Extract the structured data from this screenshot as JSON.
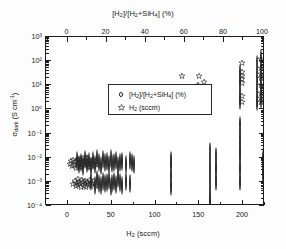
{
  "figure": {
    "background": "#ffffff",
    "frame_color": "#1b1b1b"
  },
  "axes": {
    "top": {
      "title_html": "[H<sub>2</sub>]/[H<sub>2</sub>+SiH<sub>4</sub>] (%)",
      "title_text": "[H2]/[H2+SiH4] (%)",
      "ticks": [
        0,
        20,
        40,
        60,
        80,
        100
      ],
      "tick_labels": [
        "0",
        "20",
        "40",
        "60",
        "80",
        "100"
      ],
      "lim": [
        -11,
        101
      ]
    },
    "bottom": {
      "title_html": "H<sub>2</sub> (sccm)",
      "title_text": "H2 (sccm)",
      "ticks": [
        0,
        50,
        100,
        150,
        200
      ],
      "tick_labels": [
        "0",
        "50",
        "100",
        "150",
        "200"
      ],
      "lim": [
        -25,
        225
      ]
    },
    "left": {
      "title_html": "&#963;<sub>dark</sub> (S cm<sup>-1</sup>)",
      "title_text": "sigma_dark (S cm^-1)",
      "ticks": [
        3,
        2,
        1,
        0,
        -1,
        -2,
        -3,
        -4
      ],
      "tick_labels": [
        "10³",
        "10²",
        "10¹",
        "10⁰",
        "10⁻¹",
        "10⁻²",
        "10⁻³",
        "10⁻⁴"
      ],
      "lim": [
        -4,
        3
      ],
      "scale": "log"
    }
  },
  "legend": {
    "position": "upper-left-inside",
    "entries": [
      {
        "marker": "circle-marker",
        "label_html": "[H<sub>2</sub>]/[H<sub>2</sub>+SiH<sub>4</sub>] (%)",
        "label_text": "[H2]/[H2+SiH4] (%)"
      },
      {
        "marker": "star-marker",
        "label_html": "H<sub>2</sub> (sccm)",
        "label_text": "H2 (sccm)"
      }
    ]
  },
  "chart_data": {
    "type": "scatter",
    "title": "",
    "xlabel": "H2 (sccm)",
    "ylabel": "sigma_dark (S cm^-1)",
    "xlabel_top": "[H2]/[H2+SiH4] (%)",
    "xlim": [
      -25,
      225
    ],
    "ylim": [
      0.0001,
      1000
    ],
    "xlim_top": [
      -11,
      101
    ],
    "yscale": "log",
    "grid": false,
    "legend_position": "upper left",
    "series": [
      {
        "name": "[H2]/[H2+SiH4] (%)",
        "marker": "circle",
        "x_axis": "top",
        "points": [
          [
            5,
            0.007
          ],
          [
            6,
            0.0052
          ],
          [
            7,
            0.0061
          ],
          [
            8,
            0.0043
          ],
          [
            9,
            0.008
          ],
          [
            10,
            0.0055
          ],
          [
            11,
            0.0068
          ],
          [
            12,
            0.004
          ],
          [
            13,
            0.0075
          ],
          [
            14,
            0.005
          ],
          [
            15,
            0.009
          ],
          [
            16,
            0.006
          ],
          [
            17,
            0.0046
          ],
          [
            18,
            0.0078
          ],
          [
            19,
            0.0058
          ],
          [
            20,
            0.0065
          ],
          [
            21,
            0.0049
          ],
          [
            22,
            0.0085
          ],
          [
            23,
            0.0054
          ],
          [
            24,
            0.0062
          ],
          [
            25,
            0.0072
          ],
          [
            26,
            0.0044
          ],
          [
            27,
            0.0059
          ],
          [
            28,
            0.0069
          ],
          [
            30,
            0.0051
          ],
          [
            32,
            0.0071
          ],
          [
            33,
            0.0063
          ],
          [
            34,
            0.0048
          ],
          [
            12,
            0.00095
          ],
          [
            14,
            0.0007
          ],
          [
            15,
            0.0012
          ],
          [
            16,
            0.00085
          ],
          [
            17,
            0.00065
          ],
          [
            18,
            0.001
          ],
          [
            19,
            0.00078
          ],
          [
            20,
            0.0009
          ],
          [
            21,
            0.0011
          ],
          [
            22,
            0.0006
          ],
          [
            23,
            0.00082
          ],
          [
            24,
            0.00098
          ],
          [
            25,
            0.00073
          ],
          [
            26,
            0.0013
          ],
          [
            27,
            0.00088
          ],
          [
            28,
            0.00068
          ],
          [
            30,
            0.001
          ],
          [
            32,
            0.0008
          ],
          [
            53,
            0.007
          ],
          [
            53,
            0.0055
          ],
          [
            53,
            0.0016
          ],
          [
            53,
            0.0006
          ],
          [
            73,
            0.018
          ],
          [
            73,
            0.012
          ],
          [
            73,
            0.009
          ],
          [
            73,
            0.007
          ],
          [
            73,
            0.0055
          ],
          [
            73,
            0.0042
          ],
          [
            73,
            0.0031
          ],
          [
            73,
            0.0023
          ],
          [
            73,
            0.0014
          ],
          [
            73,
            0.0009
          ],
          [
            73,
            0.00065
          ],
          [
            73,
            0.00045
          ],
          [
            73,
            0.00033
          ],
          [
            73,
            0.00024
          ],
          [
            73,
            0.00017
          ],
          [
            76,
            0.011
          ],
          [
            76,
            0.0075
          ],
          [
            76,
            0.005
          ],
          [
            76,
            0.003
          ],
          [
            76,
            0.001
          ],
          [
            88,
            0.0095
          ],
          [
            88,
            0.007
          ],
          [
            88,
            0.005
          ],
          [
            88,
            0.003
          ],
          [
            88,
            0.001
          ],
          [
            100,
            0.008
          ],
          [
            100,
            0.0055
          ],
          [
            100,
            0.0021
          ],
          [
            112,
            0.011
          ],
          [
            112,
            0.006
          ],
          [
            112,
            0.0038
          ],
          [
            88,
            0.2
          ],
          [
            88,
            0.09
          ],
          [
            88,
            0.045
          ],
          [
            88,
            0.026
          ],
          [
            88,
            0.014
          ],
          [
            88,
            4.0
          ],
          [
            88,
            30.0
          ],
          [
            88,
            20.0
          ],
          [
            88,
            12.0
          ],
          [
            88,
            3.5
          ],
          [
            88,
            2.2
          ],
          [
            97,
            70.0
          ],
          [
            97,
            50.0
          ],
          [
            97,
            40.0
          ],
          [
            97,
            32.0
          ],
          [
            97,
            25.0
          ],
          [
            97,
            18.0
          ],
          [
            97,
            12.0
          ],
          [
            97,
            8.0
          ],
          [
            97,
            5.5
          ],
          [
            97,
            4.0
          ],
          [
            97,
            2.8
          ],
          [
            97,
            2.0
          ],
          [
            99,
            120.0
          ],
          [
            99,
            60.0
          ],
          [
            99,
            35.0
          ],
          [
            99,
            20.0
          ],
          [
            99,
            9.0
          ],
          [
            99,
            4.5
          ],
          [
            99,
            2.5
          ]
        ]
      },
      {
        "name": "H2 (sccm)",
        "marker": "star",
        "x_axis": "bottom",
        "points": [
          [
            2,
            0.0055
          ],
          [
            4,
            0.007
          ],
          [
            5,
            0.0045
          ],
          [
            6,
            0.008
          ],
          [
            7,
            0.005
          ],
          [
            8,
            0.0065
          ],
          [
            9,
            0.0038
          ],
          [
            10,
            0.0075
          ],
          [
            11,
            0.0052
          ],
          [
            12,
            0.009
          ],
          [
            13,
            0.006
          ],
          [
            14,
            0.0042
          ],
          [
            15,
            0.0085
          ],
          [
            16,
            0.0058
          ],
          [
            17,
            0.01
          ],
          [
            18,
            0.0068
          ],
          [
            19,
            0.0048
          ],
          [
            20,
            0.0078
          ],
          [
            21,
            0.0054
          ],
          [
            22,
            0.0095
          ],
          [
            23,
            0.0062
          ],
          [
            24,
            0.004
          ],
          [
            25,
            0.0072
          ],
          [
            26,
            0.0056
          ],
          [
            27,
            0.0082
          ],
          [
            28,
            0.0064
          ],
          [
            30,
            0.0046
          ],
          [
            31,
            0.007
          ],
          [
            33,
            0.005
          ],
          [
            6,
            0.0008
          ],
          [
            8,
            0.0011
          ],
          [
            9,
            0.00065
          ],
          [
            10,
            0.0009
          ],
          [
            11,
            0.0013
          ],
          [
            12,
            0.00072
          ],
          [
            13,
            0.001
          ],
          [
            14,
            0.00085
          ],
          [
            15,
            0.0006
          ],
          [
            16,
            0.0012
          ],
          [
            17,
            0.00095
          ],
          [
            18,
            0.0007
          ],
          [
            19,
            0.0011
          ],
          [
            20,
            0.0008
          ],
          [
            21,
            0.00063
          ],
          [
            22,
            0.001
          ],
          [
            23,
            0.00088
          ],
          [
            24,
            0.00075
          ],
          [
            25,
            0.0012
          ],
          [
            26,
            0.00068
          ],
          [
            27,
            0.00092
          ],
          [
            28,
            0.0008
          ],
          [
            30,
            0.0011
          ],
          [
            32,
            0.0007
          ],
          [
            130,
            25.0
          ],
          [
            148,
            10.0
          ],
          [
            150,
            24.0
          ],
          [
            155,
            14.0
          ],
          [
            199,
            80.0
          ],
          [
            199,
            35.0
          ],
          [
            199,
            25.0
          ],
          [
            199,
            18.0
          ],
          [
            199,
            12.0
          ],
          [
            199,
            3.5
          ],
          [
            199,
            2.0
          ],
          [
            221,
            120.0
          ],
          [
            221,
            50.0
          ],
          [
            221,
            30.0
          ],
          [
            221,
            20.0
          ],
          [
            221,
            10.0
          ],
          [
            221,
            5.0
          ],
          [
            221,
            3.0
          ],
          [
            221,
            2.0
          ]
        ]
      }
    ]
  }
}
